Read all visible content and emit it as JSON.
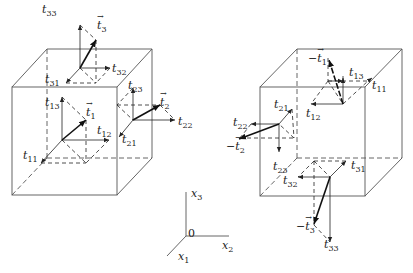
{
  "figure": {
    "left_cube": {
      "labels": [
        {
          "id": "t33",
          "base": "t",
          "sub": "33",
          "x": 42,
          "y": 4,
          "vec": false,
          "neg": false
        },
        {
          "id": "t3",
          "base": "t",
          "sub": "3",
          "x": 97,
          "y": 20,
          "vec": true,
          "neg": false
        },
        {
          "id": "t32",
          "base": "t",
          "sub": "32",
          "x": 112,
          "y": 63,
          "vec": false,
          "neg": false
        },
        {
          "id": "t31",
          "base": "t",
          "sub": "31",
          "x": 45,
          "y": 74,
          "vec": false,
          "neg": false
        },
        {
          "id": "t23",
          "base": "t",
          "sub": "23",
          "x": 128,
          "y": 80,
          "vec": false,
          "neg": false
        },
        {
          "id": "t13",
          "base": "t",
          "sub": "13",
          "x": 45,
          "y": 97,
          "vec": false,
          "neg": false
        },
        {
          "id": "t1",
          "base": "t",
          "sub": "1",
          "x": 86,
          "y": 107,
          "vec": true,
          "neg": false
        },
        {
          "id": "t2",
          "base": "t",
          "sub": "2",
          "x": 160,
          "y": 97,
          "vec": true,
          "neg": false
        },
        {
          "id": "t22",
          "base": "t",
          "sub": "22",
          "x": 178,
          "y": 116,
          "vec": false,
          "neg": false
        },
        {
          "id": "t12",
          "base": "t",
          "sub": "12",
          "x": 97,
          "y": 125,
          "vec": false,
          "neg": false
        },
        {
          "id": "t21",
          "base": "t",
          "sub": "21",
          "x": 122,
          "y": 134,
          "vec": false,
          "neg": false
        },
        {
          "id": "t11",
          "base": "t",
          "sub": "11",
          "x": 23,
          "y": 150,
          "vec": false,
          "neg": false
        }
      ]
    },
    "right_cube": {
      "labels": [
        {
          "id": "neg-t1",
          "base": "t",
          "sub": "1",
          "x": 308,
          "y": 53,
          "vec": true,
          "neg": true
        },
        {
          "id": "t13",
          "base": "t",
          "sub": "13",
          "x": 349,
          "y": 67,
          "vec": false,
          "neg": false
        },
        {
          "id": "t11",
          "base": "t",
          "sub": "11",
          "x": 372,
          "y": 80,
          "vec": false,
          "neg": false
        },
        {
          "id": "t21",
          "base": "t",
          "sub": "21",
          "x": 274,
          "y": 99,
          "vec": false,
          "neg": false
        },
        {
          "id": "t12",
          "base": "t",
          "sub": "12",
          "x": 306,
          "y": 108,
          "vec": false,
          "neg": false
        },
        {
          "id": "t22",
          "base": "t",
          "sub": "22",
          "x": 233,
          "y": 117,
          "vec": false,
          "neg": false
        },
        {
          "id": "neg-t2",
          "base": "t",
          "sub": "2",
          "x": 226,
          "y": 141,
          "vec": true,
          "neg": true
        },
        {
          "id": "t23",
          "base": "t",
          "sub": "23",
          "x": 273,
          "y": 161,
          "vec": false,
          "neg": false
        },
        {
          "id": "t31",
          "base": "t",
          "sub": "31",
          "x": 351,
          "y": 160,
          "vec": false,
          "neg": false
        },
        {
          "id": "t32",
          "base": "t",
          "sub": "32",
          "x": 283,
          "y": 175,
          "vec": false,
          "neg": false
        },
        {
          "id": "neg-t3",
          "base": "t",
          "sub": "3",
          "x": 296,
          "y": 221,
          "vec": true,
          "neg": true
        },
        {
          "id": "t33",
          "base": "t",
          "sub": "33",
          "x": 324,
          "y": 239,
          "vec": false,
          "neg": false
        }
      ]
    },
    "axes": {
      "labels": [
        {
          "id": "x3",
          "base": "x",
          "sub": "3",
          "x": 191,
          "y": 188
        },
        {
          "id": "origin",
          "base": "0",
          "sub": "",
          "x": 188,
          "y": 228
        },
        {
          "id": "x2",
          "base": "x",
          "sub": "2",
          "x": 222,
          "y": 240
        },
        {
          "id": "x1",
          "base": "x",
          "sub": "1",
          "x": 178,
          "y": 251
        }
      ]
    }
  }
}
